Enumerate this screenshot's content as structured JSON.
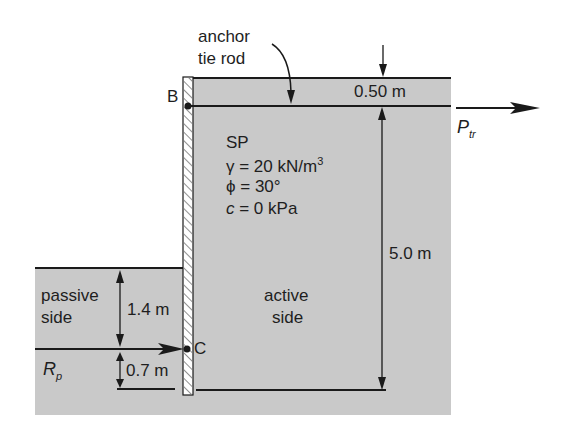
{
  "diagram": {
    "type": "anchored sheet pile wall cross-section",
    "annotations": {
      "anchor_label_line1": "anchor",
      "anchor_label_line2": "tie rod",
      "point_b": "B",
      "point_c": "C",
      "top_offset": "0.50 m",
      "tie_force_symbol": "P",
      "tie_force_sub": "tr",
      "soil_type": "SP",
      "unit_weight_prefix": "γ = 20 kN/m",
      "unit_weight_sup": "3",
      "friction_angle": "ϕ = 30°",
      "cohesion_symbol": "c",
      "cohesion_rest": " = 0 kPa",
      "active_height": "5.0 m",
      "active_label_line1": "active",
      "active_label_line2": "side",
      "passive_label_line1": "passive",
      "passive_label_line2": "side",
      "passive_height": "1.4 m",
      "reaction_offset": "0.7 m",
      "reaction_symbol": "R",
      "reaction_sub": "p"
    },
    "colors": {
      "soil_fill": "#c9c9c9",
      "line": "#1a1a1a",
      "wall_fill": "#ffffff",
      "hatch": "#555555"
    }
  }
}
